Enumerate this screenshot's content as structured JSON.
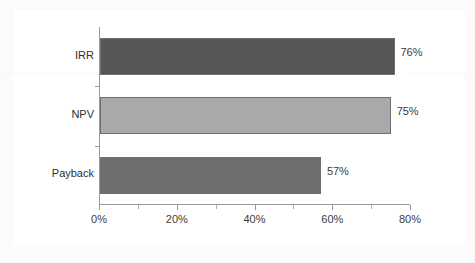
{
  "chart_data": {
    "type": "bar",
    "orientation": "horizontal",
    "title": "",
    "subtitle": "",
    "xlabel": "",
    "ylabel": "",
    "categories": [
      "IRR",
      "NPV",
      "Payback"
    ],
    "values": [
      76,
      75,
      57
    ],
    "data_labels": [
      "76%",
      "75%",
      "57%"
    ],
    "bar_colors": [
      "#565656",
      "#a9a9a9",
      "#6e6e6e"
    ],
    "bar_border_color": "#6f6f6f",
    "xlim": [
      0,
      80
    ],
    "x_major_ticks": [
      0,
      20,
      40,
      60,
      80
    ],
    "x_major_tick_labels": [
      "0%",
      "20%",
      "40%",
      "60%",
      "80%"
    ],
    "x_minor_ticks": [
      10,
      30,
      50,
      70
    ],
    "grid": false,
    "legend": false,
    "legend_position": "none",
    "axis_color": "#9a9a9a",
    "background_color": "#ffffff",
    "text_color": "#3c3c3c"
  },
  "axis": {
    "x_tick_labels": [
      "0%",
      "20%",
      "40%",
      "60%",
      "80%"
    ]
  },
  "series_rows": [
    {
      "label": "IRR",
      "value": 76,
      "data_label": "76%",
      "color": "#565656"
    },
    {
      "label": "NPV",
      "value": 75,
      "data_label": "75%",
      "color": "#a9a9a9"
    },
    {
      "label": "Payback",
      "value": 57,
      "data_label": "57%",
      "color": "#6e6e6e"
    }
  ]
}
